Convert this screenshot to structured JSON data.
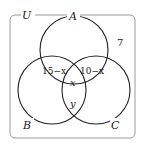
{
  "diagram": {
    "type": "venn-3",
    "universe_label": "U",
    "sets": [
      {
        "name": "A",
        "label": "A"
      },
      {
        "name": "B",
        "label": "B"
      },
      {
        "name": "C",
        "label": "C"
      }
    ],
    "regions": {
      "outside": "7",
      "a_and_b_only": "15−x",
      "a_and_c_only": "10−x",
      "a_and_b_and_c": "x",
      "b_and_c_only": "y"
    },
    "colors": {
      "stroke": "#222222",
      "frame": "#9a9a9a",
      "background": "#ffffff"
    }
  }
}
